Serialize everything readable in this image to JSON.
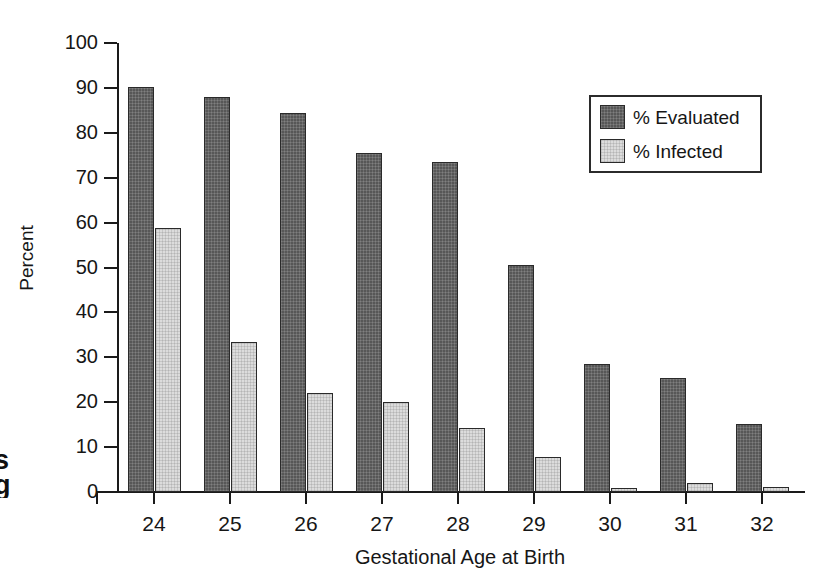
{
  "figure": {
    "margin_text_fragment": "s\ng"
  },
  "chart_data": {
    "type": "bar",
    "title": "",
    "xlabel": "Gestational Age at Birth",
    "ylabel": "Percent",
    "categories": [
      "24",
      "25",
      "26",
      "27",
      "28",
      "29",
      "30",
      "31",
      "32"
    ],
    "ylim": [
      0,
      100
    ],
    "yticks": [
      0,
      10,
      20,
      30,
      40,
      50,
      60,
      70,
      80,
      90,
      100
    ],
    "ytick_labels": [
      "0",
      "10",
      "20",
      "30",
      "40",
      "50",
      "60",
      "70",
      "80",
      "90",
      "100"
    ],
    "grid": false,
    "legend_position": "top-right",
    "series": [
      {
        "name": "% Evaluated",
        "color": "#575757",
        "values": [
          90.2,
          88.0,
          84.5,
          75.5,
          73.4,
          50.5,
          28.4,
          25.3,
          15.1
        ]
      },
      {
        "name": "% Infected",
        "color": "#dcdcdc",
        "values": [
          58.8,
          33.4,
          22.1,
          20.0,
          14.3,
          7.9,
          0.9,
          2.0,
          1.1
        ]
      }
    ]
  }
}
